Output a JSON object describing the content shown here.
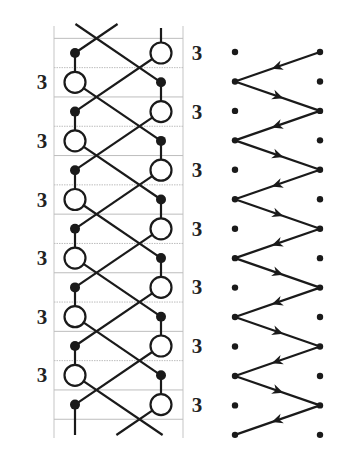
{
  "figure": {
    "left_panel": {
      "name": "braid-diagram",
      "row_count": 13,
      "row_y0": 53,
      "row_step": 29.3,
      "left_x": 75,
      "right_x": 161,
      "circle_radius": 10.5,
      "dot_radius": 5,
      "border_left_x": 54,
      "border_right_x": 183,
      "border_top_y": 26,
      "border_bottom_y": 438,
      "grid_color": "#bdbdbd",
      "line_color": "#1a1a1a",
      "label_text": "3",
      "left_label_rows": [
        1,
        3,
        5,
        7,
        9,
        11
      ],
      "right_label_rows": [
        0,
        2,
        4,
        6,
        8,
        10,
        12
      ],
      "left_label_x": 42,
      "right_label_x": 197
    },
    "right_panel": {
      "name": "zigzag-path",
      "row_count": 14,
      "row_y0": 52,
      "row_step": 29.45,
      "left_x": 235,
      "right_x": 320,
      "dot_radius": 3.2,
      "path_sides": [
        "R",
        "L",
        "R",
        "L",
        "R",
        "L",
        "R",
        "L",
        "R",
        "L",
        "R",
        "L",
        "R",
        "L"
      ],
      "line_color": "#1a1a1a"
    }
  }
}
